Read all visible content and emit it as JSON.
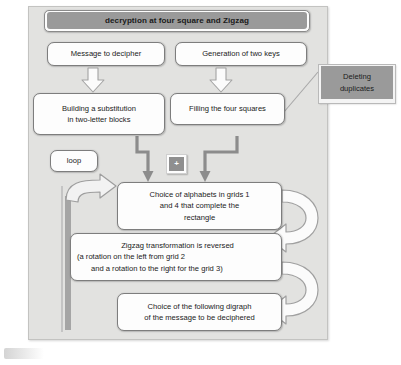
{
  "figure": {
    "title": "decryption at four square and Zigzag",
    "callout": {
      "line1": "Deleting",
      "line2": "duplicates"
    },
    "junction_symbol": "+",
    "loop_label": "loop",
    "boxes": {
      "message": "Message to decipher",
      "keygen": "Generation of two keys",
      "substitution_line1": "Building a substitution",
      "substitution_line2": "in two-letter blocks",
      "filling": "Filling the four squares",
      "choice_alphabets_line1": "Choice of alphabets in grids 1",
      "choice_alphabets_line2": "and 4 that complete the",
      "choice_alphabets_line3": "rectangle",
      "zigzag_line1": "Zigzag transformation is reversed",
      "zigzag_line2": "(a rotation on the left  from grid 2",
      "zigzag_line3": "and a rotation to the right for the grid 3)",
      "digraph_line1": "Choice of the following digraph",
      "digraph_line2": "of the message to be deciphered"
    }
  },
  "colors": {
    "panel_background": "#e2e2e0",
    "banner_fill": "#9a9a9a",
    "box_fill": "#fdfdfd",
    "box_border": "#7d7d7d",
    "arrow_fill": "#fbfbfb",
    "arrow_stroke": "#9e9e9e",
    "connector": "#8c8c8c"
  }
}
